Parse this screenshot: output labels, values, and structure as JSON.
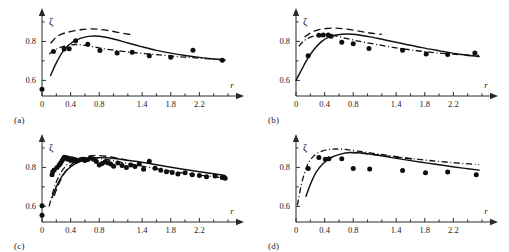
{
  "figure": {
    "background": "#ffffff",
    "marker_color": "#0d0d0d",
    "line_color": "#111111",
    "axis_color": "#2b2b2b"
  },
  "panels": [
    {
      "label": "(a)"
    },
    {
      "label": "(b)"
    },
    {
      "label": "(c)"
    },
    {
      "label": "(d)"
    }
  ],
  "chart_data": [
    {
      "type": "scatter",
      "panel": "(a)",
      "title": "",
      "xlabel": "r",
      "ylabel": "ζ",
      "xlim": [
        0,
        2.6
      ],
      "ylim": [
        0.52,
        0.92
      ],
      "grid": false,
      "legend": "none",
      "xticks": [
        0,
        0.2,
        0.4,
        0.6,
        0.8,
        1.0,
        1.2,
        1.4,
        1.6,
        1.8,
        2.0,
        2.2,
        2.4,
        2.6
      ],
      "xticklabels": [
        "0",
        "",
        "0.4",
        "",
        "0.8",
        "",
        "",
        "1.4",
        "",
        "1.8",
        "",
        "2.2",
        "",
        ""
      ],
      "yticks": [
        0.6,
        0.7,
        0.8,
        0.9
      ],
      "yticklabels": [
        "0.6",
        "",
        "0.8",
        ""
      ],
      "series": [
        {
          "name": "data-points",
          "style": "markers",
          "x": [
            0.0,
            0.16,
            0.31,
            0.38,
            0.47,
            0.64,
            0.81,
            1.05,
            1.26,
            1.5,
            1.8,
            2.11,
            2.52
          ],
          "y": [
            0.555,
            0.748,
            0.761,
            0.762,
            0.803,
            0.786,
            0.753,
            0.741,
            0.744,
            0.726,
            0.719,
            0.754,
            0.703
          ]
        },
        {
          "name": "solid-curve",
          "style": "solid",
          "x": [
            0.12,
            0.2,
            0.3,
            0.4,
            0.5,
            0.6,
            0.7,
            0.8,
            1.0,
            1.2,
            1.4,
            1.6,
            1.8,
            2.0,
            2.2,
            2.4,
            2.56
          ],
          "y": [
            0.625,
            0.69,
            0.753,
            0.789,
            0.81,
            0.822,
            0.827,
            0.826,
            0.812,
            0.792,
            0.772,
            0.754,
            0.74,
            0.728,
            0.718,
            0.71,
            0.705
          ]
        },
        {
          "name": "dashed-curve",
          "style": "dashed",
          "x": [
            0.12,
            0.2,
            0.28,
            0.36,
            0.46,
            0.56,
            0.68,
            0.8,
            0.92,
            1.04,
            1.16,
            1.24
          ],
          "y": [
            0.79,
            0.822,
            0.838,
            0.847,
            0.855,
            0.861,
            0.864,
            0.862,
            0.856,
            0.848,
            0.84,
            0.835
          ]
        },
        {
          "name": "dashdot-curve",
          "style": "dashdot",
          "x": [
            0.1,
            0.18,
            0.28,
            0.38,
            0.48,
            0.6,
            0.75,
            0.9,
            1.1,
            1.35,
            1.6,
            1.9,
            2.2,
            2.56
          ],
          "y": [
            0.735,
            0.757,
            0.772,
            0.781,
            0.784,
            0.78,
            0.77,
            0.76,
            0.75,
            0.74,
            0.732,
            0.722,
            0.714,
            0.705
          ]
        }
      ]
    },
    {
      "type": "scatter",
      "panel": "(b)",
      "title": "",
      "xlabel": "r",
      "ylabel": "ζ",
      "xlim": [
        0,
        2.6
      ],
      "ylim": [
        0.52,
        0.92
      ],
      "grid": false,
      "legend": "none",
      "xticks": [
        0,
        0.2,
        0.4,
        0.6,
        0.8,
        1.0,
        1.2,
        1.4,
        1.6,
        1.8,
        2.0,
        2.2,
        2.4,
        2.6
      ],
      "xticklabels": [
        "0",
        "",
        "0.4",
        "",
        "0.8",
        "",
        "",
        "1.4",
        "",
        "1.8",
        "",
        "2.2",
        "",
        ""
      ],
      "yticks": [
        0.6,
        0.7,
        0.8,
        0.9
      ],
      "yticklabels": [
        "0.6",
        "",
        "0.8",
        ""
      ],
      "series": [
        {
          "name": "data-points",
          "style": "markers",
          "x": [
            0.17,
            0.32,
            0.38,
            0.45,
            0.49,
            0.64,
            0.8,
            1.02,
            1.49,
            1.82,
            2.12,
            2.5
          ],
          "y": [
            0.727,
            0.832,
            0.833,
            0.833,
            0.826,
            0.796,
            0.788,
            0.763,
            0.754,
            0.736,
            0.733,
            0.74
          ]
        },
        {
          "name": "solid-curve",
          "style": "solid",
          "x": [
            0.0,
            0.08,
            0.16,
            0.26,
            0.36,
            0.46,
            0.58,
            0.72,
            0.88,
            1.06,
            1.26,
            1.5,
            1.76,
            2.0,
            2.24,
            2.46,
            2.56
          ],
          "y": [
            0.6,
            0.656,
            0.71,
            0.762,
            0.8,
            0.822,
            0.834,
            0.838,
            0.833,
            0.822,
            0.806,
            0.788,
            0.768,
            0.752,
            0.737,
            0.726,
            0.722
          ]
        },
        {
          "name": "dashed-curve",
          "style": "dashed",
          "x": [
            0.12,
            0.2,
            0.3,
            0.42,
            0.54,
            0.66,
            0.78,
            0.9,
            1.0,
            1.1,
            1.2
          ],
          "y": [
            0.822,
            0.843,
            0.858,
            0.866,
            0.868,
            0.865,
            0.859,
            0.851,
            0.845,
            0.84,
            0.836
          ]
        },
        {
          "name": "dashdot-curve",
          "style": "dashdot",
          "x": [
            0.04,
            0.1,
            0.18,
            0.28,
            0.38,
            0.5,
            0.65,
            0.85,
            1.1,
            1.4,
            1.7,
            2.0,
            2.3,
            2.56
          ],
          "y": [
            0.775,
            0.8,
            0.818,
            0.83,
            0.835,
            0.832,
            0.82,
            0.803,
            0.786,
            0.767,
            0.752,
            0.74,
            0.732,
            0.728
          ]
        }
      ]
    },
    {
      "type": "scatter",
      "panel": "(c)",
      "title": "",
      "xlabel": "r",
      "ylabel": "ζ",
      "xlim": [
        0,
        2.6
      ],
      "ylim": [
        0.52,
        0.92
      ],
      "grid": false,
      "legend": "none",
      "xticks": [
        0,
        0.2,
        0.4,
        0.6,
        0.8,
        1.0,
        1.2,
        1.4,
        1.6,
        1.8,
        2.0,
        2.2,
        2.4,
        2.6
      ],
      "xticklabels": [
        "0",
        "",
        "0.4",
        "",
        "0.8",
        "",
        "",
        "1.4",
        "",
        "1.8",
        "",
        "2.2",
        "",
        ""
      ],
      "yticks": [
        0.6,
        0.7,
        0.8,
        0.9
      ],
      "yticklabels": [
        "0.6",
        "",
        "0.8",
        ""
      ],
      "series": [
        {
          "name": "data-points",
          "style": "markers",
          "x": [
            0.0,
            0.0,
            0.14,
            0.15,
            0.17,
            0.21,
            0.24,
            0.26,
            0.28,
            0.3,
            0.31,
            0.33,
            0.35,
            0.36,
            0.38,
            0.4,
            0.42,
            0.44,
            0.46,
            0.48,
            0.52,
            0.56,
            0.6,
            0.64,
            0.68,
            0.72,
            0.76,
            0.8,
            0.84,
            0.88,
            0.92,
            0.96,
            1.0,
            1.06,
            1.12,
            1.18,
            1.24,
            1.3,
            1.36,
            1.42,
            1.5,
            1.58,
            1.66,
            1.74,
            1.82,
            1.9,
            2.0,
            2.1,
            2.2,
            2.3,
            2.42,
            2.52,
            2.56
          ],
          "y": [
            0.603,
            0.555,
            0.762,
            0.778,
            0.787,
            0.8,
            0.812,
            0.822,
            0.834,
            0.845,
            0.852,
            0.848,
            0.85,
            0.842,
            0.846,
            0.838,
            0.844,
            0.836,
            0.84,
            0.832,
            0.838,
            0.842,
            0.836,
            0.84,
            0.848,
            0.842,
            0.83,
            0.812,
            0.82,
            0.828,
            0.824,
            0.818,
            0.806,
            0.822,
            0.81,
            0.8,
            0.812,
            0.804,
            0.818,
            0.79,
            0.832,
            0.796,
            0.786,
            0.778,
            0.774,
            0.766,
            0.772,
            0.762,
            0.758,
            0.752,
            0.756,
            0.748,
            0.744
          ]
        },
        {
          "name": "solid-curve",
          "style": "solid",
          "x": [
            0.14,
            0.2,
            0.28,
            0.36,
            0.46,
            0.56,
            0.68,
            0.8,
            0.95,
            1.12,
            1.3,
            1.5,
            1.72,
            1.95,
            2.2,
            2.42,
            2.56
          ],
          "y": [
            0.645,
            0.7,
            0.755,
            0.79,
            0.818,
            0.835,
            0.846,
            0.85,
            0.848,
            0.841,
            0.832,
            0.82,
            0.806,
            0.792,
            0.778,
            0.766,
            0.758
          ]
        },
        {
          "name": "dashed-curve",
          "style": "dashed",
          "x": [
            0.17,
            0.24,
            0.32,
            0.42,
            0.54,
            0.66,
            0.78,
            0.9,
            1.0,
            1.1,
            1.18
          ],
          "y": [
            0.655,
            0.72,
            0.775,
            0.818,
            0.845,
            0.858,
            0.861,
            0.857,
            0.851,
            0.844,
            0.838
          ]
        },
        {
          "name": "dashdot-curve",
          "style": "dashdot",
          "x": [
            0.1,
            0.16,
            0.24,
            0.34,
            0.46,
            0.6,
            0.76,
            0.94,
            1.14,
            1.38,
            1.64,
            1.9,
            2.16,
            2.4,
            2.56
          ],
          "y": [
            0.6,
            0.682,
            0.758,
            0.81,
            0.838,
            0.85,
            0.848,
            0.838,
            0.824,
            0.808,
            0.79,
            0.775,
            0.762,
            0.752,
            0.746
          ]
        }
      ]
    },
    {
      "type": "scatter",
      "panel": "(d)",
      "title": "",
      "xlabel": "r",
      "ylabel": "ζ",
      "xlim": [
        0,
        2.6
      ],
      "ylim": [
        0.52,
        0.92
      ],
      "grid": false,
      "legend": "none",
      "xticks": [
        0,
        0.2,
        0.4,
        0.6,
        0.8,
        1.0,
        1.2,
        1.4,
        1.6,
        1.8,
        2.0,
        2.2,
        2.4,
        2.6
      ],
      "xticklabels": [
        "0",
        "",
        "0.4",
        "",
        "0.8",
        "",
        "",
        "1.4",
        "",
        "1.8",
        "",
        "2.2",
        "",
        ""
      ],
      "yticks": [
        0.6,
        0.7,
        0.8,
        0.9
      ],
      "yticklabels": [
        "0.6",
        "",
        "0.8",
        ""
      ],
      "series": [
        {
          "name": "data-points",
          "style": "markers",
          "x": [
            0.17,
            0.32,
            0.41,
            0.46,
            0.64,
            0.8,
            1.03,
            1.49,
            1.81,
            2.12,
            2.52
          ],
          "y": [
            0.795,
            0.851,
            0.842,
            0.845,
            0.845,
            0.794,
            0.792,
            0.784,
            0.773,
            0.776,
            0.762
          ]
        },
        {
          "name": "solid-curve",
          "style": "solid",
          "x": [
            0.14,
            0.2,
            0.28,
            0.38,
            0.5,
            0.62,
            0.76,
            0.92,
            1.12,
            1.34,
            1.58,
            1.84,
            2.1,
            2.36,
            2.56
          ],
          "y": [
            0.652,
            0.712,
            0.775,
            0.82,
            0.852,
            0.868,
            0.876,
            0.874,
            0.864,
            0.85,
            0.836,
            0.822,
            0.808,
            0.795,
            0.786
          ]
        },
        {
          "name": "dashdot-curve",
          "style": "dashdot",
          "x": [
            0.02,
            0.08,
            0.16,
            0.26,
            0.38,
            0.52,
            0.68,
            0.86,
            1.08,
            1.32,
            1.6,
            1.9,
            2.2,
            2.45,
            2.56
          ],
          "y": [
            0.605,
            0.72,
            0.812,
            0.862,
            0.886,
            0.894,
            0.892,
            0.884,
            0.872,
            0.86,
            0.846,
            0.834,
            0.824,
            0.817,
            0.814
          ]
        },
        {
          "name": "dashed-curve",
          "style": "dashed",
          "x": [
            0.76,
            0.9,
            1.04,
            1.2,
            1.36,
            1.52,
            1.68
          ],
          "y": [
            0.876,
            0.873,
            0.868,
            0.861,
            0.854,
            0.847,
            0.841
          ]
        }
      ]
    }
  ]
}
